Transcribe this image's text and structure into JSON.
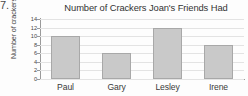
{
  "worksheet": {
    "problem_number": "7."
  },
  "chart_data": {
    "type": "bar",
    "title": "Number of Crackers Joan's Friends Had",
    "xlabel": "",
    "ylabel": "Number of crackers",
    "categories": [
      "Paul",
      "Gary",
      "Lesley",
      "Irene"
    ],
    "values": [
      10,
      6,
      12,
      8
    ],
    "ylim": [
      0,
      14
    ],
    "yticks": [
      0,
      2,
      4,
      6,
      8,
      10,
      12,
      14
    ],
    "ytick_labels": [
      "0",
      "2",
      "4",
      "6",
      "8",
      "10",
      "12",
      "14"
    ],
    "grid": true,
    "legend": false,
    "bar_color": "#c9c9c9",
    "bar_border_color": "#a8a8a8",
    "gridline_color": "#e3e3e3",
    "axis_color": "#9a9a9a"
  }
}
